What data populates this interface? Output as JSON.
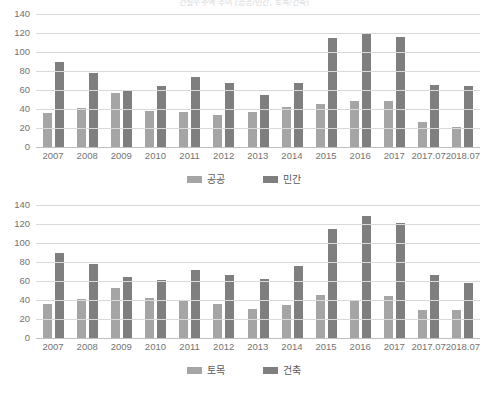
{
  "page": {
    "title": "건설수주액 추이 (공공/민간, 토목/건축)"
  },
  "chart_data": [
    {
      "type": "bar",
      "title": "",
      "xlabel": "",
      "ylabel": "",
      "ylim": [
        0,
        140
      ],
      "yticks": [
        140,
        120,
        100,
        80,
        60,
        40,
        20,
        0
      ],
      "grid": true,
      "legend_position": "bottom",
      "categories": [
        "2007",
        "2008",
        "2009",
        "2010",
        "2011",
        "2012",
        "2013",
        "2014",
        "2015",
        "2016",
        "2017",
        "2017.07",
        "2018.07"
      ],
      "series": [
        {
          "name": "공공",
          "color": "#a5a5a5",
          "values": [
            36,
            41,
            57,
            38,
            37,
            34,
            37,
            42,
            45,
            48,
            48,
            26,
            21
          ]
        },
        {
          "name": "민간",
          "color": "#7f7f7f",
          "values": [
            90,
            78,
            59,
            64,
            74,
            67,
            55,
            67,
            115,
            120,
            116,
            65,
            64
          ]
        }
      ]
    },
    {
      "type": "bar",
      "title": "",
      "xlabel": "",
      "ylabel": "",
      "ylim": [
        0,
        140
      ],
      "yticks": [
        140,
        120,
        100,
        80,
        60,
        40,
        20,
        0
      ],
      "grid": true,
      "legend_position": "bottom",
      "categories": [
        "2007",
        "2008",
        "2009",
        "2010",
        "2011",
        "2012",
        "2013",
        "2014",
        "2015",
        "2016",
        "2017",
        "2017.07",
        "2018.07"
      ],
      "series": [
        {
          "name": "토목",
          "color": "#a5a5a5",
          "values": [
            36,
            41,
            53,
            42,
            39,
            36,
            31,
            35,
            45,
            40,
            44,
            29,
            30
          ]
        },
        {
          "name": "건축",
          "color": "#7f7f7f",
          "values": [
            90,
            78,
            64,
            61,
            72,
            66,
            62,
            76,
            115,
            128,
            121,
            66,
            58
          ]
        }
      ]
    }
  ]
}
